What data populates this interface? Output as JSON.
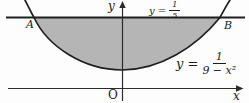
{
  "colors": {
    "shade": "#b5b5b5",
    "stroke": "#1f1f1f",
    "axis": "#2b2b2b"
  },
  "axes": {
    "x_label": "x",
    "y_label": "y",
    "origin": "O"
  },
  "points": {
    "a": "A",
    "b": "B"
  },
  "line_label": {
    "lhs": "y =",
    "num": "1",
    "den": "5"
  },
  "curve_label": {
    "lhs": "y =",
    "num": "1",
    "den": "9 − x²"
  }
}
